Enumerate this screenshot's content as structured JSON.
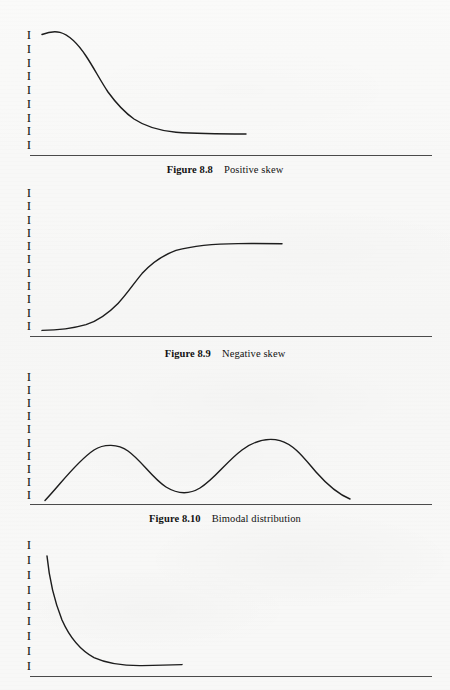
{
  "page": {
    "background_color": "#f8f8f7",
    "ink_color": "#1d1d1d",
    "axis_color": "#4b4b4b",
    "width": 450,
    "height": 690
  },
  "figures": [
    {
      "id": "figure-8-8",
      "caption_label": "Figure 8.8",
      "caption_text": "Positive skew",
      "tick_glyph": "I",
      "tick_count": 9,
      "axis": {
        "x_origin": 30,
        "x_end": 432,
        "baseline_y": 155,
        "y_top": 30,
        "y_bottom": 150
      },
      "caption_y": 164
    },
    {
      "id": "figure-8-9",
      "caption_label": "Figure 8.9",
      "caption_text": "Negative skew",
      "tick_glyph": "I",
      "tick_count": 11,
      "axis": {
        "x_origin": 30,
        "x_end": 432,
        "baseline_y": 336,
        "y_top": 188,
        "y_bottom": 331
      },
      "caption_y": 348
    },
    {
      "id": "figure-8-10",
      "caption_label": "Figure 8.10",
      "caption_text": "Bimodal distribution",
      "tick_glyph": "I",
      "tick_count": 10,
      "axis": {
        "x_origin": 30,
        "x_end": 432,
        "baseline_y": 504,
        "y_top": 372,
        "y_bottom": 500
      },
      "caption_y": 513
    },
    {
      "id": "figure-untitled-4",
      "caption_label": "",
      "caption_text": "",
      "tick_glyph": "I",
      "tick_count": 9,
      "axis": {
        "x_origin": 30,
        "x_end": 432,
        "baseline_y": 676,
        "y_top": 540,
        "y_bottom": 671
      },
      "caption_y": 0
    }
  ],
  "chart_data": [
    {
      "type": "line",
      "title": "Figure 8.8  Positive skew",
      "xlabel": "",
      "ylabel": "",
      "grid": false,
      "legend": "none",
      "axis_ticks_y": 9,
      "x": [
        42,
        50,
        58,
        68,
        80,
        92,
        104,
        116,
        128,
        140,
        152,
        164,
        176,
        190,
        205,
        222,
        240,
        246
      ],
      "y": [
        34,
        32,
        31,
        33,
        39,
        49,
        62,
        76,
        89,
        100,
        109,
        116,
        121,
        125,
        128,
        130,
        132,
        133
      ],
      "description": "Tall plateau on the left falling in a smooth sigmoid to a low right-hand tail (positive skew)."
    },
    {
      "type": "line",
      "title": "Figure 8.9  Negative skew",
      "xlabel": "",
      "ylabel": "",
      "grid": false,
      "legend": "none",
      "axis_ticks_y": 11,
      "x": [
        42,
        56,
        70,
        84,
        96,
        108,
        120,
        132,
        144,
        156,
        170,
        186,
        204,
        224,
        246,
        268,
        282
      ],
      "y": [
        330,
        329,
        327,
        323,
        317,
        307,
        295,
        282,
        270,
        261,
        253,
        249,
        246,
        245,
        244,
        244,
        244
      ],
      "description": "Low flat left tail rising in a smooth sigmoid to a high plateau on the right (negative skew)."
    },
    {
      "type": "line",
      "title": "Figure 8.10  Bimodal distribution",
      "xlabel": "",
      "ylabel": "",
      "grid": false,
      "legend": "none",
      "axis_ticks_y": 10,
      "x": [
        45,
        58,
        72,
        86,
        100,
        112,
        125,
        140,
        155,
        170,
        183,
        196,
        210,
        225,
        240,
        255,
        268,
        282,
        296,
        310,
        325,
        340,
        350
      ],
      "y": [
        500,
        488,
        473,
        459,
        450,
        447,
        449,
        456,
        467,
        478,
        487,
        491,
        488,
        478,
        464,
        451,
        442,
        440,
        446,
        458,
        472,
        489,
        497
      ],
      "peaks": [
        {
          "x": 112,
          "y": 447
        },
        {
          "x": 282,
          "y": 440
        }
      ],
      "trough": {
        "x": 196,
        "y": 491
      },
      "description": "Two rounded modes of similar height separated by a central trough."
    },
    {
      "type": "line",
      "title": "",
      "xlabel": "",
      "ylabel": "",
      "grid": false,
      "legend": "none",
      "axis_ticks_y": 9,
      "x": [
        47,
        51,
        56,
        62,
        69,
        77,
        86,
        96,
        107,
        119,
        132,
        146,
        160,
        172,
        182
      ],
      "y": [
        556,
        572,
        590,
        606,
        620,
        633,
        644,
        652,
        658,
        662,
        664,
        665,
        665,
        664,
        664
      ],
      "description": "Steep exponential decay from a high left-hand start flattening to a long low tail."
    }
  ]
}
